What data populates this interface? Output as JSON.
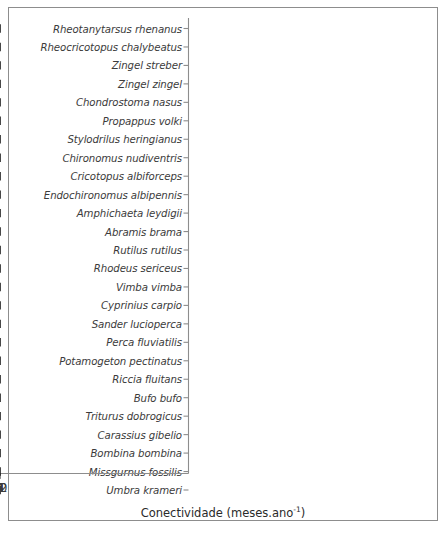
{
  "figure": {
    "background_color": "#ffffff",
    "frame_color": "#8d8d8d",
    "data_color": "#1a1a1a"
  },
  "axis": {
    "x_title_main": "Conectividade (meses.ano",
    "x_title_sup": "-1",
    "x_title_close": ")",
    "x_title_full": "Conectividade (meses.ano-1)",
    "x_ticks": [
      "0",
      "2",
      "4",
      "6",
      "8",
      "10",
      "12"
    ],
    "x_tick_values": [
      0,
      2,
      4,
      6,
      8,
      10,
      12
    ],
    "x_min": 0,
    "x_max": 12
  },
  "chart_data": {
    "type": "scatter",
    "title": "",
    "xlabel": "Conectividade (meses.ano-1)",
    "ylabel": "",
    "xlim": [
      0,
      12
    ],
    "grid": false,
    "legend": "none",
    "marker": "plus",
    "categories": [
      "Rheotanytarsus rhenanus",
      "Rheocricotopus chalybeatus",
      "Zingel streber",
      "Zingel zingel",
      "Chondrostoma nasus",
      "Propappus volki",
      "Stylodrilus heringianus",
      "Chironomus nudiventris",
      "Cricotopus albiforceps",
      "Endochironomus albipennis",
      "Amphichaeta leydigii",
      "Abramis brama",
      "Rutilus rutilus",
      "Rhodeus sericeus",
      "Vimba vimba",
      "Cyprinius carpio",
      "Sander lucioperca",
      "Perca fluviatilis",
      "Potamogeton pectinatus",
      "Riccia fluitans",
      "Bufo bufo",
      "Triturus dobrogicus",
      "Carassius gibelio",
      "Bombina bombina",
      "Missgurnus fossilis",
      "Umbra krameri"
    ],
    "points": [
      {
        "label": "Rheotanytarsus rhenanus",
        "center": 12.0,
        "low": 12.0,
        "high": 12.0
      },
      {
        "label": "Rheocricotopus chalybeatus",
        "center": 12.0,
        "low": 12.0,
        "high": 12.0
      },
      {
        "label": "Zingel streber",
        "center": 12.0,
        "low": 12.0,
        "high": 12.0
      },
      {
        "label": "Zingel zingel",
        "center": 12.0,
        "low": 12.0,
        "high": 12.0
      },
      {
        "label": "Chondrostoma nasus",
        "center": 11.4,
        "low": 5.2,
        "high": 12.0
      },
      {
        "label": "Propappus volki",
        "center": 9.3,
        "low": 0.4,
        "high": 12.0
      },
      {
        "label": "Stylodrilus heringianus",
        "center": 9.3,
        "low": 0.7,
        "high": 12.0
      },
      {
        "label": "Chironomus nudiventris",
        "center": 9.3,
        "low": 0.7,
        "high": 12.0
      },
      {
        "label": "Cricotopus albiforceps",
        "center": 9.2,
        "low": 6.8,
        "high": 12.0
      },
      {
        "label": "Endochironomus albipennis",
        "center": 2.9,
        "low": 0.8,
        "high": 6.9
      },
      {
        "label": "Amphichaeta leydigii",
        "center": 2.5,
        "low": 0.4,
        "high": 6.9
      },
      {
        "label": "Abramis brama",
        "center": 1.5,
        "low": 0.0,
        "high": 12.0
      },
      {
        "label": "Rutilus rutilus",
        "center": 0.5,
        "low": 0.0,
        "high": 10.0
      },
      {
        "label": "Rhodeus sericeus",
        "center": 0.3,
        "low": 0.0,
        "high": 7.0
      },
      {
        "label": "Vimba vimba",
        "center": 0.3,
        "low": 0.0,
        "high": 7.0
      },
      {
        "label": "Cyprinius carpio",
        "center": 0.3,
        "low": 0.0,
        "high": 12.0
      },
      {
        "label": "Sander lucioperca",
        "center": 0.2,
        "low": 0.0,
        "high": 10.4
      },
      {
        "label": "Perca fluviatilis",
        "center": 0.2,
        "low": 0.0,
        "high": 10.2
      },
      {
        "label": "Potamogeton pectinatus",
        "center": 0.3,
        "low": 0.0,
        "high": 0.8
      },
      {
        "label": "Riccia fluitans",
        "center": 0.3,
        "low": 0.0,
        "high": 0.7
      },
      {
        "label": "Bufo bufo",
        "center": 0.1,
        "low": 0.0,
        "high": 2.7
      },
      {
        "label": "Triturus dobrogicus",
        "center": 0.3,
        "low": 0.0,
        "high": 0.7
      },
      {
        "label": "Carassius gibelio",
        "center": 0.25,
        "low": 0.0,
        "high": 0.7
      },
      {
        "label": "Bombina bombina",
        "center": 0.3,
        "low": 0.0,
        "high": 1.0
      },
      {
        "label": "Missgurnus fossilis",
        "center": 0.05,
        "low": 0.0,
        "high": 0.05
      },
      {
        "label": "Umbra krameri",
        "center": 0.05,
        "low": 0.0,
        "high": 0.05
      }
    ]
  }
}
